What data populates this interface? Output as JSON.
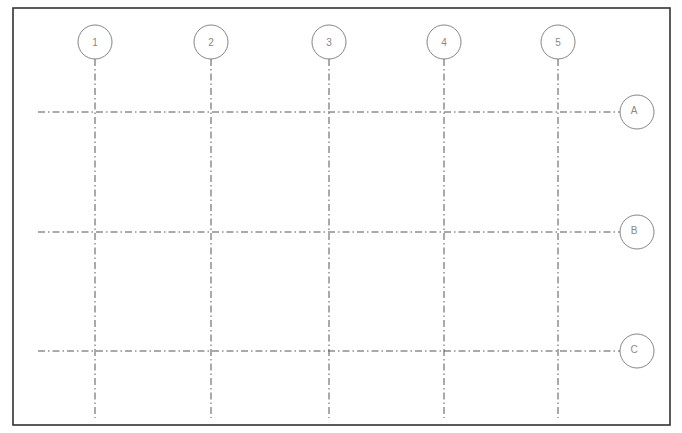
{
  "diagram": {
    "type": "structural-grid-plan",
    "frame": {
      "x": 13,
      "y": 8,
      "width": 657,
      "height": 417
    },
    "line_color": "#555555",
    "bubble_stroke": "#777777",
    "label_color": "#888888",
    "columns": [
      {
        "label": "1",
        "x": 95
      },
      {
        "label": "2",
        "x": 211
      },
      {
        "label": "3",
        "x": 329
      },
      {
        "label": "4",
        "x": 444
      },
      {
        "label": "5",
        "x": 558
      }
    ],
    "rows": [
      {
        "label": "A",
        "y": 112
      },
      {
        "label": "B",
        "y": 232
      },
      {
        "label": "C",
        "y": 351
      }
    ],
    "column_bubble_y": 42,
    "row_bubble_x": 637,
    "bubble_radius": 17,
    "column_line_extent": {
      "y1": 59,
      "y2": 418
    },
    "row_line_extent": {
      "x1": 38,
      "x2": 620
    }
  }
}
